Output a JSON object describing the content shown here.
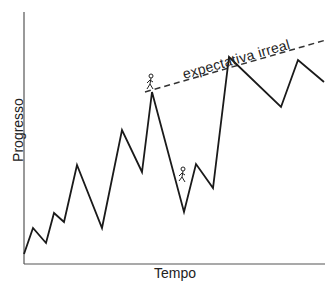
{
  "chart_data": {
    "type": "line",
    "title": "",
    "xlabel": "Tempo",
    "ylabel": "Progresso",
    "grid": false,
    "legend": null,
    "points_px": [
      [
        24,
        254
      ],
      [
        33,
        228
      ],
      [
        46,
        243
      ],
      [
        54,
        213
      ],
      [
        64,
        222
      ],
      [
        77,
        165
      ],
      [
        102,
        228
      ],
      [
        122,
        130
      ],
      [
        142,
        172
      ],
      [
        152,
        92
      ],
      [
        184,
        212
      ],
      [
        196,
        164
      ],
      [
        213,
        188
      ],
      [
        229,
        57
      ],
      [
        281,
        107
      ],
      [
        298,
        60
      ],
      [
        324,
        82
      ]
    ],
    "x": [
      0,
      1,
      2,
      3,
      4,
      5,
      6,
      7,
      8,
      9,
      10,
      11,
      12,
      13,
      14,
      15,
      16
    ],
    "values": [
      5,
      18,
      10,
      25,
      21,
      50,
      18,
      67,
      46,
      86,
      26,
      50,
      38,
      104,
      79,
      102,
      91
    ],
    "annotations": [
      {
        "text": "expectativa irreal",
        "type": "dashed-line",
        "from_px": [
          145,
          92
        ],
        "to_px": [
          325,
          40
        ]
      },
      {
        "text": "climber-figure-at-peak",
        "at_px": [
          152,
          82
        ]
      },
      {
        "text": "climber-figure-on-slope",
        "at_px": [
          182,
          175
        ]
      }
    ]
  },
  "labels": {
    "xlabel": "Tempo",
    "ylabel": "Progresso",
    "annotation": "expectativa irreal"
  },
  "colors": {
    "line": "#1a1a1a",
    "axis": "#555555",
    "text": "#222222",
    "background": "#ffffff"
  }
}
